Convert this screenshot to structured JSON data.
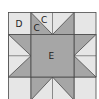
{
  "diagram": {
    "type": "quilt-block",
    "labels": {
      "corner": "D",
      "point_outer": "C",
      "point_inner": "C",
      "center": "E"
    },
    "colors": {
      "background": "#ffffff",
      "light_fabric": "#e6e6e6",
      "dark_fabric": "#a6a6a6",
      "seam_line": "#4a4a4a"
    }
  }
}
